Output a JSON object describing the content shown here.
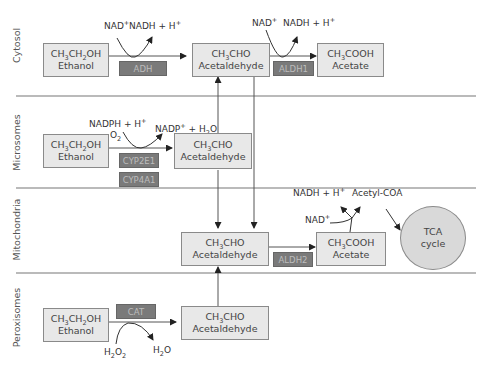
{
  "compartments": [
    {
      "id": "cytosol",
      "label": "Cytosol"
    },
    {
      "id": "microsomes",
      "label": "Microsomes"
    },
    {
      "id": "mitochondria",
      "label": "Mitochondria"
    },
    {
      "id": "peroxisomes",
      "label": "Peroxisomes"
    }
  ],
  "cytosol": {
    "ethanol": {
      "formula_parts": [
        "CH",
        "3",
        "CH",
        "2",
        "OH"
      ],
      "name": "Ethanol"
    },
    "enzyme1": "ADH",
    "cofactor_in1": "NAD",
    "cofactor_out1": "NADH + H",
    "acetaldehyde": {
      "name": "Acetaldehyde"
    },
    "enzyme2": "ALDH1",
    "cofactor_in2": "NAD",
    "cofactor_out2": "NADH + H",
    "acetate": {
      "name": "Acetate"
    }
  },
  "microsomes": {
    "ethanol": {
      "name": "Ethanol"
    },
    "cofactor_in": "NADPH + H",
    "oxygen": "O",
    "cofactor_out": "NADP",
    "water_out": " + H",
    "enzymes": [
      "CYP2E1",
      "CYP4A1"
    ],
    "acetaldehyde": {
      "name": "Acetaldehyde"
    }
  },
  "mitochondria": {
    "acetaldehyde": {
      "name": "Acetaldehyde"
    },
    "enzyme": "ALDH2",
    "acetate": {
      "name": "Acetate"
    },
    "cofactor_in": "NAD",
    "cofactor_out": "NADH + H",
    "product": "Acetyl-COA",
    "tca": {
      "line1": "TCA",
      "line2": "cycle"
    }
  },
  "peroxisomes": {
    "ethanol": {
      "name": "Ethanol"
    },
    "enzyme": "CAT",
    "h2o2": "H",
    "h2o": "H",
    "acetaldehyde": {
      "name": "Acetaldehyde"
    }
  },
  "colors": {
    "box_fill": "#e8e8e8",
    "box_border": "#8a8a8a",
    "enzyme_fill": "#7a7a7a",
    "enzyme_text": "#bdbdbd",
    "tca_fill": "#d9d9d9",
    "divider": "#777777"
  }
}
